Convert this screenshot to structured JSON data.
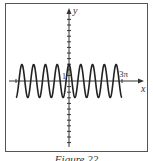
{
  "figure": {
    "caption": "Figure 22",
    "axis_labels": {
      "x": "x",
      "y": "y"
    },
    "tick_labels": {
      "y_one": "1",
      "x_end": "3π"
    }
  },
  "chart_data": {
    "type": "line",
    "title": "",
    "function": "y = cos(3x)",
    "xlabel": "x",
    "ylabel": "y",
    "xlim": [
      -9.42,
      9.42
    ],
    "ylim": [
      -10,
      10
    ],
    "annotations": [
      "1",
      "3π"
    ],
    "grid": false,
    "series": [
      {
        "name": "cos(3x)",
        "x_range": [
          "-3π",
          "3π"
        ],
        "amplitude": 1,
        "period": "2π/3"
      }
    ]
  }
}
